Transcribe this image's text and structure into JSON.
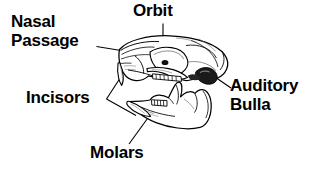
{
  "figure": {
    "background_color": "#ffffff",
    "line_color": "#000000",
    "shade_color": "#6e6e6e",
    "labels": [
      {
        "id": "nasal-passage",
        "text": "Nasal\nPassage",
        "lines": [
          "Nasal",
          "Passage"
        ]
      },
      {
        "id": "orbit",
        "text": "Orbit",
        "lines": [
          "Orbit"
        ]
      },
      {
        "id": "auditory-bulla",
        "text": "Auditory\nBulla",
        "lines": [
          "Auditory",
          "Bulla"
        ]
      },
      {
        "id": "incisors",
        "text": "Incisors",
        "lines": [
          "Incisors"
        ]
      },
      {
        "id": "molars",
        "text": "Molars",
        "lines": [
          "Molars"
        ]
      }
    ],
    "structures": [
      {
        "id": "cranium",
        "name": "cranium"
      },
      {
        "id": "rostrum",
        "name": "rostrum-nasal-region"
      },
      {
        "id": "upper-incisor",
        "name": "upper-incisor"
      },
      {
        "id": "upper-molars",
        "name": "upper-molar-row"
      },
      {
        "id": "auditory-bulla",
        "name": "auditory-bulla"
      },
      {
        "id": "zygomatic-arch",
        "name": "zygomatic-arch"
      },
      {
        "id": "mandible",
        "name": "mandible"
      },
      {
        "id": "lower-incisor",
        "name": "lower-incisor"
      },
      {
        "id": "lower-molars",
        "name": "lower-molar-row"
      }
    ]
  }
}
